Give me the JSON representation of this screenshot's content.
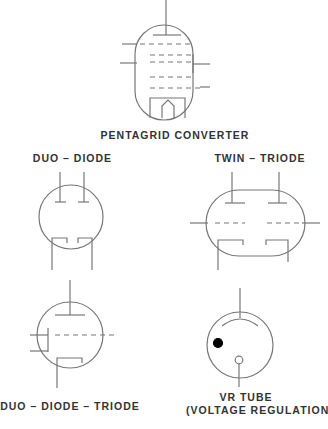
{
  "labels": {
    "pentagrid": "PENTAGRID CONVERTER",
    "duo_diode": "DUO – DIODE",
    "twin_triode": "TWIN – TRIODE",
    "duo_diode_triode": "DUO – DIODE – TRIODE",
    "vr_tube_line1": "VR TUBE",
    "vr_tube_line2": "(VOLTAGE REGULATION)"
  },
  "colors": {
    "stroke": "#777777",
    "text": "#333333",
    "dot": "#000000"
  }
}
